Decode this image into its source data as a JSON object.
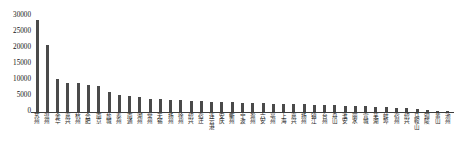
{
  "chart_data": {
    "type": "bar",
    "title": "",
    "xlabel": "",
    "ylabel": "",
    "ylim": [
      0,
      30000
    ],
    "yticks": [
      0,
      5000,
      10000,
      15000,
      20000,
      25000,
      30000
    ],
    "ytick_labels": [
      "0",
      "5000",
      "10000",
      "15000",
      "20000",
      "25000",
      "30000"
    ],
    "grid": false,
    "legend": null,
    "bar_color": "#4a4a4a",
    "axis_color": "#3d3d3d",
    "categories": [
      "苏州",
      "温州",
      "金华",
      "嘉兴",
      "杭州",
      "合肥",
      "南京",
      "盐城",
      "泰州",
      "南通",
      "湖州",
      "常州",
      "无锡",
      "扬州",
      "徐州",
      "绍兴",
      "宿迁",
      "连云港",
      "安庆",
      "衢州",
      "宁波",
      "滁州",
      "六安",
      "亳州",
      "上海",
      "嘉兴",
      "扬州",
      "镇江",
      "台州",
      "舟山",
      "淮安",
      "丽水",
      "宣城",
      "芜湖",
      "蚌埠",
      "宿州",
      "绍兴",
      "马鞍山",
      "铜陵",
      "黄山",
      "池州"
    ],
    "values": [
      28700,
      21000,
      10200,
      9100,
      9000,
      8300,
      8200,
      6400,
      5300,
      5000,
      4700,
      4200,
      4000,
      3800,
      3600,
      3500,
      3300,
      3200,
      3100,
      3000,
      2900,
      2800,
      2700,
      2600,
      2550,
      2500,
      2400,
      2300,
      2200,
      2100,
      2000,
      1900,
      1800,
      1700,
      1500,
      1300,
      1100,
      800,
      500,
      350,
      250
    ]
  }
}
